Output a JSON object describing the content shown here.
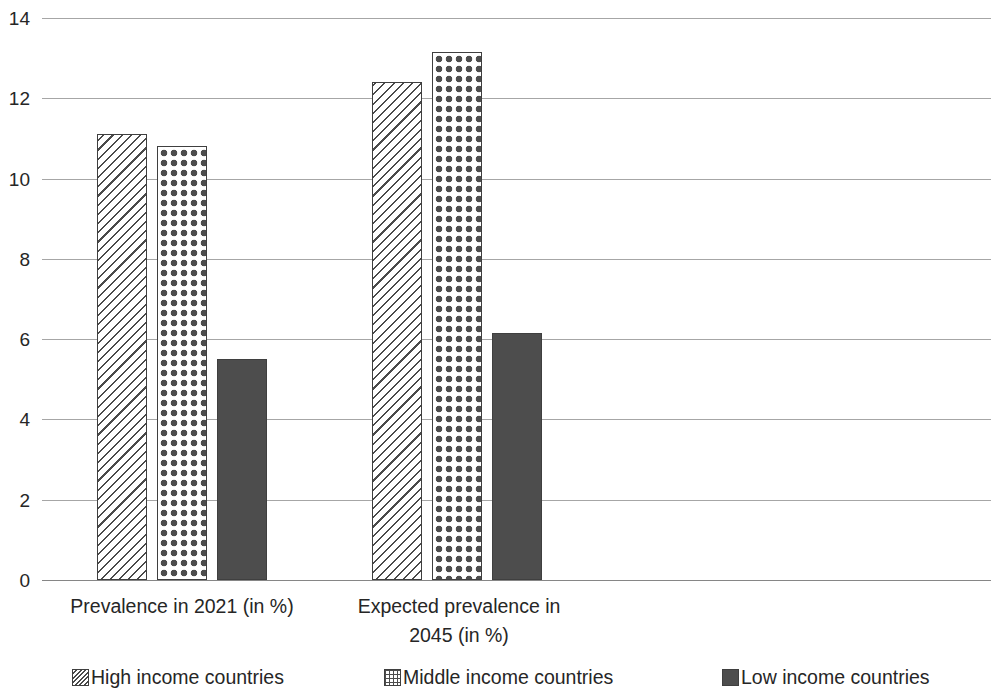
{
  "chart_data": {
    "type": "bar",
    "title": "",
    "subtitle": "",
    "xlabel": "",
    "ylabel": "",
    "categories": [
      "Prevalence in 2021 (in %)",
      "Expected prevalence in 2045 (in %)"
    ],
    "series": [
      {
        "name": "High income countries",
        "pattern": "diagonal-hatch",
        "values": [
          11.1,
          12.4
        ]
      },
      {
        "name": "Middle income countries",
        "pattern": "dotted-grid",
        "values": [
          10.8,
          13.15
        ]
      },
      {
        "name": "Low income countries",
        "pattern": "solid-dark-gray",
        "values": [
          5.5,
          6.15
        ]
      }
    ],
    "ylim": [
      0,
      14
    ],
    "ytick_values": [
      14,
      12,
      10,
      8,
      6,
      4,
      2,
      0
    ],
    "ytick_labels": [
      "14",
      "12",
      "10",
      "8",
      "6",
      "4",
      "2",
      "0"
    ],
    "grid": "horizontal",
    "legend_position": "bottom",
    "colors": {
      "bar_outline": "#3f3f3f",
      "solid_fill": "#4d4d4d",
      "hatch_stroke": "#4a4a4a",
      "dot_fill": "#4d4d4d",
      "gridline": "#a6a6a6",
      "axis_line": "#868686",
      "text": "#262626",
      "background": "#ffffff"
    }
  },
  "axis": {
    "ticks": [
      {
        "label": "14",
        "value": 14
      },
      {
        "label": "12",
        "value": 12
      },
      {
        "label": "10",
        "value": 10
      },
      {
        "label": "8",
        "value": 8
      },
      {
        "label": "6",
        "value": 6
      },
      {
        "label": "4",
        "value": 4
      },
      {
        "label": "2",
        "value": 2
      },
      {
        "label": "0",
        "value": 0
      }
    ]
  },
  "category_labels": [
    {
      "text": "Prevalence in 2021 (in %)"
    },
    {
      "text": "Expected prevalence in 2045 (in %)"
    }
  ],
  "legend": {
    "items": [
      {
        "label": "High income countries",
        "swatch": "hatch-swatch-icon"
      },
      {
        "label": "Middle income countries",
        "swatch": "grid-dots-swatch-icon"
      },
      {
        "label": "Low income countries",
        "swatch": "solid-swatch-icon"
      }
    ]
  }
}
